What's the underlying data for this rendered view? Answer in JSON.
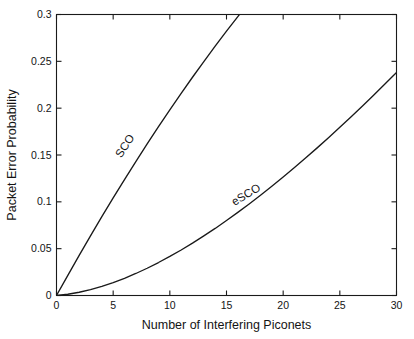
{
  "chart_data": {
    "type": "line",
    "title": "",
    "xlabel": "Number of Interfering Piconets",
    "ylabel": "Packet Error Probability",
    "xlim": [
      0,
      30
    ],
    "ylim": [
      0,
      0.3
    ],
    "grid": false,
    "legend_position": "inline-curve-labels",
    "xticks": [
      0,
      5,
      10,
      15,
      20,
      25,
      30
    ],
    "xticklabels": [
      "0",
      "5",
      "10",
      "15",
      "20",
      "25",
      "30"
    ],
    "yticks": [
      0,
      0.05,
      0.1,
      0.15,
      0.2,
      0.25,
      0.3
    ],
    "yticklabels": [
      "0",
      "0.05",
      "0.1",
      "0.15",
      "0.2",
      "0.25",
      "0.3"
    ],
    "x": [
      0,
      1,
      2,
      3,
      4,
      5,
      6,
      7,
      8,
      9,
      10,
      11,
      12,
      13,
      14,
      15,
      16,
      17,
      18,
      19,
      20,
      21,
      22,
      23,
      24,
      25,
      26,
      27,
      28,
      29,
      30
    ],
    "series": [
      {
        "name": "SCO",
        "label": "SCO",
        "color": "#1a1a1a",
        "clipped_at_x": 14.1,
        "values": [
          0,
          0.0215,
          0.0428,
          0.0637,
          0.0842,
          0.1042,
          0.1238,
          0.143,
          0.1618,
          0.1802,
          0.1982,
          0.2158,
          0.233,
          0.2498,
          0.2662,
          0.2822,
          0.2978,
          0.313,
          0.3278,
          0.3422,
          0.3562,
          0.3698,
          0.383,
          0.3958,
          0.4082,
          0.4202,
          0.4318,
          0.443,
          0.4538,
          0.4642,
          0.4742
        ]
      },
      {
        "name": "eSCO",
        "label": "eSCO",
        "color": "#1a1a1a",
        "values": [
          0,
          0.0013,
          0.0035,
          0.0063,
          0.0098,
          0.0138,
          0.0184,
          0.0235,
          0.0291,
          0.0352,
          0.0417,
          0.0486,
          0.0559,
          0.0636,
          0.0716,
          0.08,
          0.0887,
          0.0977,
          0.107,
          0.1166,
          0.1265,
          0.1366,
          0.147,
          0.1576,
          0.1685,
          0.1796,
          0.1909,
          0.2024,
          0.2141,
          0.226,
          0.2381
        ]
      }
    ],
    "annotations": [
      {
        "text": "SCO",
        "x_px": 128,
        "y_px": 148,
        "rotation": -57
      },
      {
        "text": "eSCO",
        "x_px": 248,
        "y_px": 198,
        "rotation": -31
      }
    ]
  }
}
